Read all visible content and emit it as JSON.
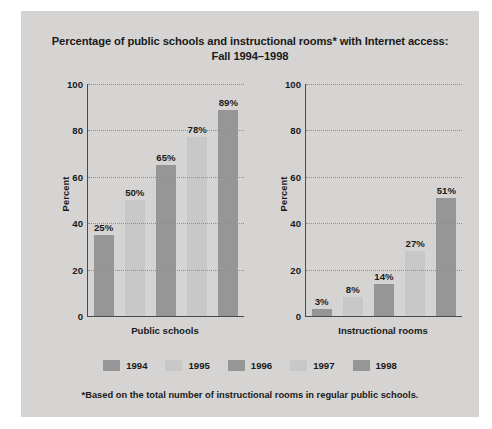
{
  "title": {
    "line1": "Percentage of public schools and instructional rooms* with Internet access:",
    "line2": "Fall 1994–1998"
  },
  "footnote": "*Based on the total number of instructional rooms in regular public schools.",
  "legend": {
    "items": [
      {
        "label": "1994",
        "color": "#969696"
      },
      {
        "label": "1995",
        "color": "#c8c8c8"
      },
      {
        "label": "1996",
        "color": "#969696"
      },
      {
        "label": "1997",
        "color": "#c8c8c8"
      },
      {
        "label": "1998",
        "color": "#969696"
      }
    ]
  },
  "axis": {
    "ticks": [
      "100",
      "80",
      "60",
      "40",
      "20",
      "0"
    ]
  },
  "charts": {
    "left": {
      "xlabel": "Public schools",
      "ylabel": "Percent"
    },
    "right": {
      "xlabel": "Instructional rooms",
      "ylabel": "Percent"
    }
  },
  "chart_data": [
    {
      "type": "bar",
      "title": "Percentage of public schools with Internet access: Fall 1994–1998",
      "xlabel": "Public schools",
      "ylabel": "Percent",
      "categories": [
        "1994",
        "1995",
        "1996",
        "1997",
        "1998"
      ],
      "values": [
        25,
        50,
        65,
        78,
        89
      ],
      "data_labels": [
        "25%",
        "50%",
        "65%",
        "78%",
        "89%"
      ],
      "drawn_bar_tops": [
        35,
        50,
        65,
        77,
        89
      ],
      "colors": [
        "#969696",
        "#c8c8c8",
        "#969696",
        "#c8c8c8",
        "#969696"
      ],
      "ylim": [
        0,
        100
      ],
      "yticks": [
        0,
        20,
        40,
        60,
        80,
        100
      ],
      "grid": true,
      "legend_position": "bottom-shared"
    },
    {
      "type": "bar",
      "title": "Percentage of instructional rooms with Internet access: Fall 1994–1998",
      "xlabel": "Instructional rooms",
      "ylabel": "Percent",
      "categories": [
        "1994",
        "1995",
        "1996",
        "1997",
        "1998"
      ],
      "values": [
        3,
        8,
        14,
        27,
        51
      ],
      "data_labels": [
        "3%",
        "8%",
        "14%",
        "27%",
        "51%"
      ],
      "drawn_bar_tops": [
        3,
        8,
        14,
        28,
        51
      ],
      "colors": [
        "#969696",
        "#c8c8c8",
        "#969696",
        "#c8c8c8",
        "#969696"
      ],
      "ylim": [
        0,
        100
      ],
      "yticks": [
        0,
        20,
        40,
        60,
        80,
        100
      ],
      "grid": true,
      "legend_position": "bottom-shared"
    }
  ]
}
